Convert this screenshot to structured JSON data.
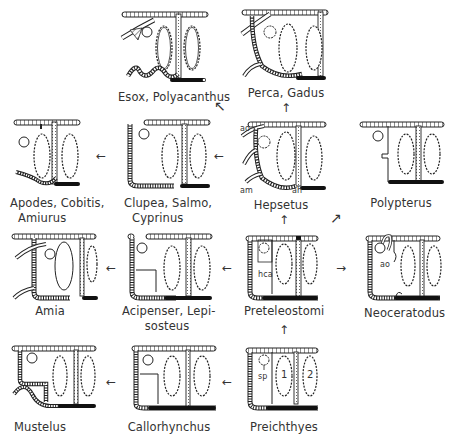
{
  "diagram": {
    "type": "evolutionary-flow-diagram",
    "nodes": [
      {
        "id": "esox",
        "label": "Esox, Polyacanthus",
        "label_display": "Esox, Polyacanthus"
      },
      {
        "id": "perca",
        "label": "Perca, Gadus"
      },
      {
        "id": "apodes",
        "label_line1": "Apodes, Cobitis,",
        "label_line2": "Amiurus"
      },
      {
        "id": "clupea",
        "label_line1": "Clupea, Salmo,",
        "label_line2": "Cyprinus"
      },
      {
        "id": "hepsetus",
        "label": "Hepsetus",
        "annotations": [
          "ao",
          "am",
          "ah"
        ]
      },
      {
        "id": "polypterus",
        "label": "Polypterus"
      },
      {
        "id": "amia",
        "label": "Amia"
      },
      {
        "id": "acipenser",
        "label_line1": "Acipenser, Lepi-",
        "label_line2": "sosteus"
      },
      {
        "id": "preteleostomi",
        "label": "Preteleostomi",
        "annotations": [
          "hca"
        ]
      },
      {
        "id": "neoceratodus",
        "label": "Neoceratodus",
        "annotations": [
          "ao"
        ]
      },
      {
        "id": "mustelus",
        "label": "Mustelus"
      },
      {
        "id": "callorhynchus",
        "label": "Callorhynchus"
      },
      {
        "id": "preichthyes",
        "label": "Preichthyes",
        "annotations": [
          "sp",
          "1",
          "2"
        ]
      }
    ],
    "edges": [
      {
        "from": "preichthyes",
        "to": "preteleostomi",
        "direction": "up"
      },
      {
        "from": "preichthyes",
        "to": "callorhynchus",
        "direction": "left"
      },
      {
        "from": "callorhynchus",
        "to": "mustelus",
        "direction": "left"
      },
      {
        "from": "preteleostomi",
        "to": "acipenser",
        "direction": "left"
      },
      {
        "from": "preteleostomi",
        "to": "neoceratodus",
        "direction": "right"
      },
      {
        "from": "preteleostomi",
        "to": "hepsetus",
        "direction": "up"
      },
      {
        "from": "preteleostomi",
        "to": "polypterus",
        "direction": "up-right"
      },
      {
        "from": "acipenser",
        "to": "amia",
        "direction": "left"
      },
      {
        "from": "hepsetus",
        "to": "clupea",
        "direction": "left"
      },
      {
        "from": "hepsetus",
        "to": "perca",
        "direction": "up"
      },
      {
        "from": "hepsetus",
        "to": "esox",
        "direction": "up-left"
      },
      {
        "from": "clupea",
        "to": "apodes",
        "direction": "left"
      }
    ],
    "annotation_labels": {
      "hepsetus_ao": "ao",
      "hepsetus_am": "am",
      "hepsetus_ah": "ah",
      "preteleostomi_hca": "hca",
      "neoceratodus_ao": "ao",
      "preichthyes_sp": "sp",
      "preichthyes_1": "1",
      "preichthyes_2": "2"
    },
    "arrows": {
      "left": "←",
      "right": "→",
      "up": "↑",
      "up_left": "↖",
      "up_right": "↗"
    }
  }
}
